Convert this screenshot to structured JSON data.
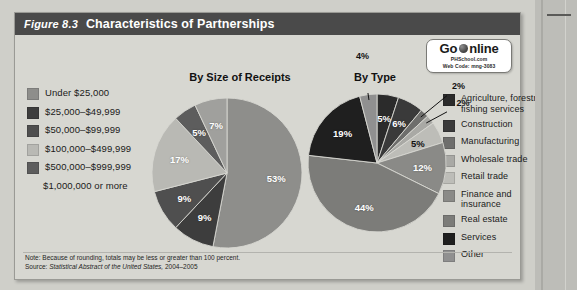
{
  "figure": {
    "number": "Figure 8.3",
    "title": "Characteristics of Partnerships"
  },
  "go_online": {
    "go": "Go",
    "globe_icon": "globe-icon",
    "online": "nline",
    "site": "PHSchool.com",
    "web_code": "Web Code: mng-3083"
  },
  "legend_left": {
    "items": [
      {
        "label": "Under $25,000",
        "color": "#8e8e8b"
      },
      {
        "label": "$25,000–$49,999",
        "color": "#3d3d3d"
      },
      {
        "label": "$50,000–$99,999",
        "color": "#4f4f4f"
      },
      {
        "label": "$100,000–$499,999",
        "color": "#b9b9b4"
      },
      {
        "label": "$500,000–$999,999",
        "color": "#5d5d5d"
      },
      {
        "label": "$1,000,000 or more",
        "color": "transparent"
      }
    ]
  },
  "legend_right": {
    "items": [
      {
        "label": "Agriculture, forestry, fishing services",
        "color": "#2b2b2b"
      },
      {
        "label": "Construction",
        "color": "#3a3a3a"
      },
      {
        "label": "Manufacturing",
        "color": "#6e6e6c"
      },
      {
        "label": "Wholesale trade",
        "color": "#a9a9a5"
      },
      {
        "label": "Retail trade",
        "color": "#bdbdb8"
      },
      {
        "label": "Finance and insurance",
        "color": "#8a8a87"
      },
      {
        "label": "Real estate",
        "color": "#7c7c79"
      },
      {
        "label": "Services",
        "color": "#1f1f1f"
      },
      {
        "label": "Other",
        "color": "#909090"
      }
    ]
  },
  "footnote": {
    "note": "Note: Because of rounding, totals may be less or greater than 100 percent.",
    "source_prefix": "Source: ",
    "source_italic": "Statistical Abstract of the United States,",
    "source_suffix": " 2004–2005"
  },
  "chart_data": [
    {
      "type": "pie",
      "title": "By Size of Receipts",
      "categories": [
        "Under $25,000",
        "$25,000–$49,999",
        "$50,000–$99,999",
        "$100,000–$499,999",
        "$500,000–$999,999",
        "$1,000,000 or more"
      ],
      "values": [
        53,
        9,
        9,
        17,
        5,
        7
      ],
      "labels": [
        "53%",
        "9%",
        "9%",
        "17%",
        "5%",
        "7%"
      ],
      "colors": [
        "#8e8e8b",
        "#3d3d3d",
        "#4f4f4f",
        "#b9b9b4",
        "#5d5d5d",
        "#a0a09d"
      ],
      "unit": "percent",
      "legend_position": "left",
      "start_angle": 0
    },
    {
      "type": "pie",
      "title": "By Type",
      "categories": [
        "Agriculture, forestry, fishing services",
        "Construction",
        "Manufacturing",
        "Wholesale trade",
        "Retail trade",
        "Finance and insurance",
        "Real estate",
        "Services",
        "Other"
      ],
      "values": [
        5,
        6,
        2,
        2,
        5,
        12,
        44,
        19,
        4
      ],
      "labels": [
        "5%",
        "6%",
        "2%",
        "2%",
        "5%",
        "12%",
        "44%",
        "19%",
        "4%"
      ],
      "colors": [
        "#2b2b2b",
        "#3a3a3a",
        "#6e6e6c",
        "#a9a9a5",
        "#bdbdb8",
        "#8a8a87",
        "#7c7c79",
        "#1f1f1f",
        "#909090"
      ],
      "unit": "percent",
      "legend_position": "right",
      "start_angle": 0
    }
  ]
}
